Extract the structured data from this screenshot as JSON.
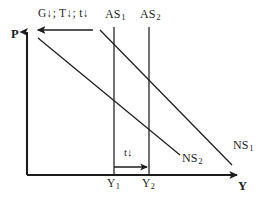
{
  "figure": {
    "kind": "economics-as-ns-diagram",
    "ink_color": "#1d1d1d",
    "background_color": "#ffffff"
  },
  "axes": {
    "vertical_label": "P",
    "horizontal_label": "Y",
    "origin_x": 27,
    "origin_y": 175,
    "top_y": 32,
    "right_x": 237
  },
  "annotations": {
    "policy_label": "G↓; T↓; t↓",
    "tax_shift_label": "t↓"
  },
  "curves": [
    {
      "name": "AS1",
      "label": "AS",
      "subscript": "1",
      "type": "vertical",
      "x": 114,
      "y_top": 27,
      "y_bottom": 175
    },
    {
      "name": "AS2",
      "label": "AS",
      "subscript": "2",
      "type": "vertical",
      "x": 149,
      "y_top": 27,
      "y_bottom": 175
    },
    {
      "name": "NS2",
      "label": "NS",
      "subscript": "2",
      "type": "downward-sloping",
      "x1": 38,
      "y1": 38,
      "x2": 180,
      "y2": 155
    },
    {
      "name": "NS1",
      "label": "NS",
      "subscript": "1",
      "type": "downward-sloping",
      "x1": 100,
      "y1": 30,
      "x2": 232,
      "y2": 165
    }
  ],
  "ticks": [
    {
      "name": "Y1",
      "label": "Y",
      "subscript": "1",
      "x": 114
    },
    {
      "name": "Y2",
      "label": "Y",
      "subscript": "2",
      "x": 149
    }
  ],
  "shift_arrows": [
    {
      "name": "ns-curve-leftward-shift-arrow",
      "direction": "left",
      "x_from": 93,
      "x_to": 38,
      "y": 30
    },
    {
      "name": "output-rightward-shift-arrow",
      "direction": "right",
      "x_from": 114,
      "x_to": 149,
      "y": 167
    }
  ]
}
